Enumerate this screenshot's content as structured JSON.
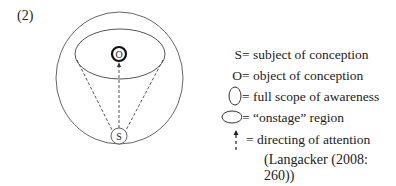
{
  "example_number": "(2)",
  "diagram": {
    "object_label": "O",
    "subject_label": "S"
  },
  "legend": [
    {
      "symbol": "S",
      "text": "= subject of conception"
    },
    {
      "symbol": "O",
      "text": "= object of conception"
    },
    {
      "symbol_icon": "vertical-ellipse-icon",
      "text": "= full scope of awareness"
    },
    {
      "symbol_icon": "horizontal-ellipse-icon",
      "text": "= “onstage” region"
    },
    {
      "symbol_icon": "dashed-arrow-icon",
      "text": "= directing of attention"
    }
  ],
  "citation": "(Langacker (2008: 260))",
  "colors": {
    "line": "#555555",
    "text": "#222222",
    "bold_circle": "#111111"
  }
}
